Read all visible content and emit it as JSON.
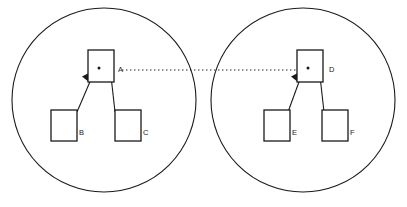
{
  "diagram": {
    "background_color": "#ffffff",
    "stroke_color": "#1a1a1a",
    "groups": [
      {
        "id": "left-group",
        "circle": {
          "cx": 104,
          "cy": 100,
          "r": 92
        },
        "parent": {
          "id": "A",
          "label": "A",
          "box": {
            "x": 88,
            "y": 50,
            "w": 26,
            "h": 32
          },
          "label_pos": {
            "x": 118,
            "y": 70
          },
          "dot": {
            "cx": 99,
            "cy": 68,
            "r": 1.5
          }
        },
        "children": [
          {
            "id": "B",
            "label": "B",
            "box": {
              "x": 51,
              "y": 110,
              "w": 26,
              "h": 31
            },
            "label_pos": {
              "x": 79,
              "y": 133
            }
          },
          {
            "id": "C",
            "label": "C",
            "box": {
              "x": 115,
              "y": 110,
              "w": 26,
              "h": 31
            },
            "label_pos": {
              "x": 143,
              "y": 133
            }
          }
        ],
        "edges": [
          {
            "from": "B",
            "to": "A",
            "arrow": "into-parent"
          },
          {
            "from": "C",
            "to": "A",
            "arrow": "into-parent"
          }
        ]
      },
      {
        "id": "right-group",
        "circle": {
          "cx": 303,
          "cy": 100,
          "r": 92
        },
        "parent": {
          "id": "D",
          "label": "D",
          "box": {
            "x": 297,
            "y": 50,
            "w": 26,
            "h": 32
          },
          "label_pos": {
            "x": 329,
            "y": 70
          },
          "dot": {
            "cx": 308,
            "cy": 68,
            "r": 1.5
          }
        },
        "children": [
          {
            "id": "E",
            "label": "E",
            "box": {
              "x": 264,
              "y": 110,
              "w": 26,
              "h": 31
            },
            "label_pos": {
              "x": 292,
              "y": 133
            }
          },
          {
            "id": "F",
            "label": "F",
            "box": {
              "x": 322,
              "y": 110,
              "w": 26,
              "h": 31
            },
            "label_pos": {
              "x": 350,
              "y": 133
            }
          }
        ],
        "edges": [
          {
            "from": "E",
            "to": "D",
            "arrow": "into-parent"
          },
          {
            "from": "F",
            "to": "D",
            "arrow": "into-parent"
          }
        ]
      }
    ],
    "cross_link": {
      "id": "A-D-link",
      "style": "dotted",
      "from": "A",
      "to": "D",
      "x1": 122,
      "x2": 296,
      "y": 70
    }
  }
}
